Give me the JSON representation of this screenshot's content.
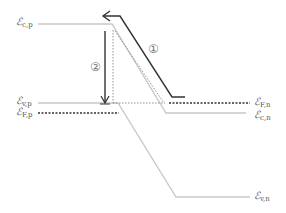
{
  "diagram": {
    "type": "band-diagram",
    "labels": {
      "ec_p": {
        "main": "ℰ",
        "sub": "c,p"
      },
      "ev_p": {
        "main": "ℰ",
        "sub": "v,p"
      },
      "ef_p": {
        "main": "ℰ",
        "sub": "F,p"
      },
      "ef_n": {
        "main": "ℰ",
        "sub": "F,n"
      },
      "ec_n": {
        "main": "ℰ",
        "sub": "c,n"
      },
      "ev_n": {
        "main": "ℰ",
        "sub": "v,n"
      }
    },
    "markers": {
      "step1": "①",
      "step2": "②"
    },
    "colors": {
      "band_line": "#c8c8c8",
      "fermi_line": "#333333",
      "arrow": "#333333",
      "dotted_guide": "#888888",
      "label": "#555555"
    }
  }
}
